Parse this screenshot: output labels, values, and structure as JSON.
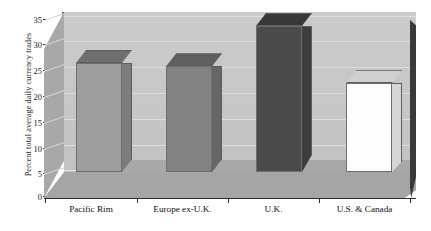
{
  "chart_data": {
    "type": "bar",
    "title": "",
    "subtitle": "",
    "xlabel": "",
    "ylabel": "Percent total average daily currency trades",
    "categories": [
      "Pacific Rim",
      "Europe ex-U.K.",
      "U.K.",
      "U.S. & Canada"
    ],
    "values": [
      24.8,
      24.0,
      33.2,
      20.2
    ],
    "series": [
      {
        "name": "Percent total average daily currency trades",
        "values": [
          24.8,
          24.0,
          33.2,
          20.2
        ]
      }
    ],
    "bar_colors": [
      "#9e9e9e",
      "#828282",
      "#4a4a4a",
      "#fdfdfd"
    ],
    "bar_top_colors": [
      "#6f6f6f",
      "#5e5e5e",
      "#383838",
      "#d0d0d0"
    ],
    "bar_side_colors": [
      "#7c7c7c",
      "#666666",
      "#3d3d3d",
      "#d6d6d6"
    ],
    "ylim": [
      0,
      35
    ],
    "ytick_values": [
      0,
      5,
      10,
      15,
      20,
      25,
      30,
      35
    ],
    "ytick_labels": [
      "0",
      "5",
      "10",
      "15",
      "20",
      "25",
      "30",
      "35"
    ],
    "grid": true,
    "legend": false,
    "legend_position": "none",
    "style": "3d-bar",
    "plot_background": "#c6c6c6",
    "floor_color": "#a8a8a8"
  },
  "axes": {
    "y_title": "Percent total average daily currency trades",
    "y_ticks": [
      "0",
      "5",
      "10",
      "15",
      "20",
      "25",
      "30",
      "35"
    ],
    "x_labels": [
      "Pacific Rim",
      "Europe ex-U.K.",
      "U.K.",
      "U.S. & Canada"
    ]
  }
}
